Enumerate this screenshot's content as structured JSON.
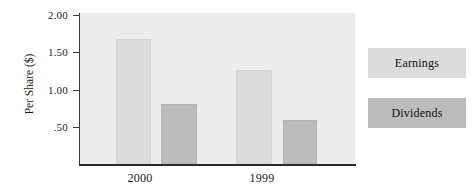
{
  "chart_data": {
    "type": "bar",
    "title": "",
    "xlabel": "",
    "ylabel": "Per Share ($)",
    "categories": [
      "2000",
      "1999"
    ],
    "series": [
      {
        "name": "Earnings",
        "values": [
          1.66,
          1.24
        ],
        "color": "#dcdcdc"
      },
      {
        "name": "Dividends",
        "values": [
          0.79,
          0.58
        ],
        "color": "#bcbcbc"
      }
    ],
    "ylim": [
      0,
      2.0
    ],
    "yticks": [
      2.0,
      1.5,
      1.0,
      0.5
    ],
    "ytick_labels": [
      "2.00",
      "1.50",
      "1.00",
      ".50"
    ],
    "grid": false,
    "legend_position": "right",
    "plot_background": "#ededed"
  },
  "axes": {
    "y_title": "Per Share ($)",
    "y_ticks": [
      {
        "label": "2.00",
        "value": 2.0
      },
      {
        "label": "1.50",
        "value": 1.5
      },
      {
        "label": "1.00",
        "value": 1.0
      },
      {
        "label": ".50",
        "value": 0.5
      }
    ],
    "x_ticks": [
      {
        "label": "2000"
      },
      {
        "label": "1999"
      }
    ]
  },
  "legend": {
    "entries": [
      {
        "label": "Earnings",
        "color": "#dcdcdc"
      },
      {
        "label": "Dividends",
        "color": "#bcbcbc"
      }
    ]
  },
  "bars": [
    {
      "group": "2000",
      "series": "Earnings",
      "value": 1.66
    },
    {
      "group": "2000",
      "series": "Dividends",
      "value": 0.79
    },
    {
      "group": "1999",
      "series": "Earnings",
      "value": 1.24
    },
    {
      "group": "1999",
      "series": "Dividends",
      "value": 0.58
    }
  ]
}
